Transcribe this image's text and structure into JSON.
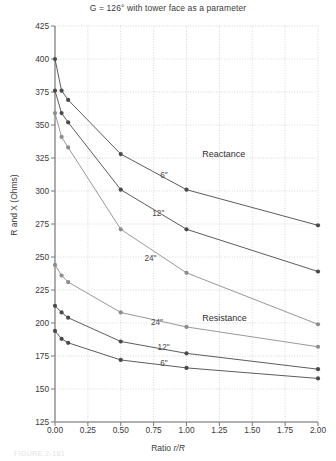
{
  "chart_data": {
    "type": "line",
    "title": "G = 126° with tower face as a parameter",
    "xlabel": "Ratio r/R",
    "ylabel": "R and X (Ohms)",
    "xlim": [
      0.0,
      2.0
    ],
    "ylim": [
      125,
      425
    ],
    "xticks": [
      "0.00",
      "0.25",
      "0.50",
      "0.75",
      "1.00",
      "1.25",
      "1.50",
      "1.75",
      "2.00"
    ],
    "xtick_values": [
      0.0,
      0.25,
      0.5,
      0.75,
      1.0,
      1.25,
      1.5,
      1.75,
      2.0
    ],
    "yticks": [
      "125",
      "150",
      "175",
      "200",
      "225",
      "250",
      "275",
      "300",
      "325",
      "350",
      "375",
      "400",
      "425"
    ],
    "ytick_values": [
      125,
      150,
      175,
      200,
      225,
      250,
      275,
      300,
      325,
      350,
      375,
      400,
      425
    ],
    "grid": true,
    "legend_position": "inline-annotations",
    "annotations": [
      {
        "text": "Reactance",
        "x": 1.12,
        "y": 327,
        "size": "big"
      },
      {
        "text": "Resistance",
        "x": 1.12,
        "y": 203,
        "size": "big"
      },
      {
        "text": "6\"",
        "x": 0.8,
        "y": 311,
        "size": "small"
      },
      {
        "text": "12\"",
        "x": 0.74,
        "y": 282,
        "size": "small"
      },
      {
        "text": "24\"",
        "x": 0.68,
        "y": 248,
        "size": "small"
      },
      {
        "text": "24\"",
        "x": 0.73,
        "y": 199,
        "size": "small"
      },
      {
        "text": "12\"",
        "x": 0.78,
        "y": 180,
        "size": "small"
      },
      {
        "text": "6\"",
        "x": 0.8,
        "y": 168,
        "size": "small"
      }
    ],
    "series": [
      {
        "name": "Reactance 6\"",
        "group": "Reactance",
        "tower_face": "6\"",
        "color": "#4a4a4a",
        "x": [
          0.0,
          0.05,
          0.1,
          0.5,
          1.0,
          2.0
        ],
        "y": [
          400,
          376,
          369,
          328,
          301,
          274
        ]
      },
      {
        "name": "Reactance 12\"",
        "group": "Reactance",
        "tower_face": "12\"",
        "color": "#4a4a4a",
        "x": [
          0.0,
          0.05,
          0.1,
          0.5,
          1.0,
          2.0
        ],
        "y": [
          376,
          359,
          352,
          301,
          271,
          239
        ]
      },
      {
        "name": "Reactance 24\"",
        "group": "Reactance",
        "tower_face": "24\"",
        "color": "#8c8c8c",
        "x": [
          0.0,
          0.05,
          0.1,
          0.5,
          1.0,
          2.0
        ],
        "y": [
          359,
          341,
          333,
          271,
          238,
          199
        ]
      },
      {
        "name": "Resistance 24\"",
        "group": "Resistance",
        "tower_face": "24\"",
        "color": "#8c8c8c",
        "x": [
          0.0,
          0.05,
          0.1,
          0.5,
          1.0,
          2.0
        ],
        "y": [
          244,
          236,
          231,
          208,
          197,
          182
        ]
      },
      {
        "name": "Resistance 12\"",
        "group": "Resistance",
        "tower_face": "12\"",
        "color": "#4a4a4a",
        "x": [
          0.0,
          0.05,
          0.1,
          0.5,
          1.0,
          2.0
        ],
        "y": [
          213,
          208,
          204,
          186,
          177,
          165
        ]
      },
      {
        "name": "Resistance 6\"",
        "group": "Resistance",
        "tower_face": "6\"",
        "color": "#4a4a4a",
        "x": [
          0.0,
          0.05,
          0.1,
          0.5,
          1.0,
          2.0
        ],
        "y": [
          194,
          188,
          185,
          172,
          166,
          158
        ]
      }
    ]
  },
  "caption": {
    "text": "FIGURE 2-181"
  }
}
